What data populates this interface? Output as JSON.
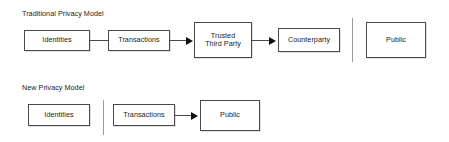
{
  "diagram": {
    "type": "flow-diagram",
    "sections": [
      {
        "id": "traditional",
        "title": "Traditional Privacy Model",
        "nodes": [
          {
            "id": "t-identities",
            "label": "Identities"
          },
          {
            "id": "t-transactions",
            "label": "Transactions"
          },
          {
            "id": "t-ttp",
            "label": "Trusted\nThird Party"
          },
          {
            "id": "t-counterparty",
            "label": "Counterparty"
          },
          {
            "id": "t-public",
            "label": "Public"
          }
        ],
        "connections": [
          {
            "from": "t-identities",
            "to": "t-transactions",
            "arrow": false
          },
          {
            "from": "t-transactions",
            "to": "t-ttp",
            "arrow": true
          },
          {
            "from": "t-ttp",
            "to": "t-counterparty",
            "arrow": true
          }
        ],
        "divider_after": "t-counterparty"
      },
      {
        "id": "new",
        "title": "New Privacy Model",
        "nodes": [
          {
            "id": "n-identities",
            "label": "Identities"
          },
          {
            "id": "n-transactions",
            "label": "Transactions"
          },
          {
            "id": "n-public",
            "label": "Public"
          }
        ],
        "connections": [
          {
            "from": "n-transactions",
            "to": "n-public",
            "arrow": true
          }
        ],
        "divider_after": "n-identities"
      }
    ]
  },
  "colors": {
    "box_border": "#4a4a4a",
    "line": "#4a4a4a",
    "arrow": "#111111",
    "divider": "#9a9a9a",
    "text": "#1a1a1a",
    "background": "#ffffff"
  }
}
